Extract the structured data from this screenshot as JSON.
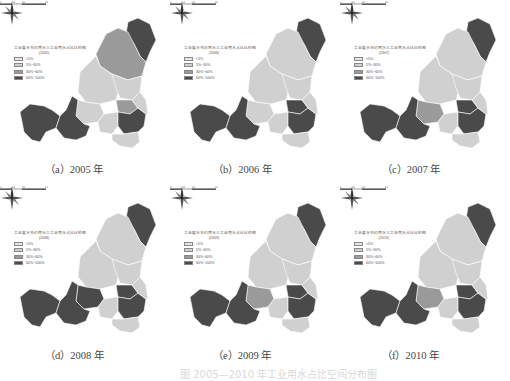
{
  "figure": {
    "legend": {
      "title": "工业废水节约用水三工业用水占比比较图",
      "classes": [
        {
          "label": "<5%",
          "color": "#e6e6e6"
        },
        {
          "label": "5%~30%",
          "color": "#d0d0d0"
        },
        {
          "label": "30%~60%",
          "color": "#9a9a9a"
        },
        {
          "label": "60%~100%",
          "color": "#4a4a4a"
        }
      ]
    },
    "scale_ticks": [
      "0",
      "15",
      "30",
      "60"
    ],
    "panels": [
      {
        "id": "a",
        "caption": "（a）2005 年",
        "year_tag": "(2005)",
        "classes": {
          "north_tip": 3,
          "north": 2,
          "center": 1,
          "right": 1,
          "mid_left": 1,
          "mid_right_small": 2,
          "south_mid": 1,
          "se_dark": 3,
          "se_bottom": 1,
          "west_left": 3,
          "west_right": 3,
          "east_strip": 1
        }
      },
      {
        "id": "b",
        "caption": "（b）2006 年",
        "year_tag": "(2006)",
        "classes": {
          "north_tip": 3,
          "north": 1,
          "center": 1,
          "right": 1,
          "mid_left": 1,
          "mid_right_small": 3,
          "south_mid": 1,
          "se_dark": 3,
          "se_bottom": 1,
          "west_left": 3,
          "west_right": 3,
          "east_strip": 1
        }
      },
      {
        "id": "c",
        "caption": "（c）2007 年",
        "year_tag": "(2007)",
        "classes": {
          "north_tip": 3,
          "north": 1,
          "center": 1,
          "right": 1,
          "mid_left": 2,
          "mid_right_small": 3,
          "south_mid": 1,
          "se_dark": 3,
          "se_bottom": 1,
          "west_left": 3,
          "west_right": 3,
          "east_strip": 1
        }
      },
      {
        "id": "d",
        "caption": "（d）2008 年",
        "year_tag": "(2008)",
        "classes": {
          "north_tip": 3,
          "north": 1,
          "center": 1,
          "right": 1,
          "mid_left": 3,
          "mid_right_small": 3,
          "south_mid": 1,
          "se_dark": 3,
          "se_bottom": 1,
          "west_left": 3,
          "west_right": 3,
          "east_strip": 1
        }
      },
      {
        "id": "e",
        "caption": "（e）2009 年",
        "year_tag": "(2009)",
        "classes": {
          "north_tip": 3,
          "north": 1,
          "center": 1,
          "right": 1,
          "mid_left": 2,
          "mid_right_small": 3,
          "south_mid": 1,
          "se_dark": 3,
          "se_bottom": 1,
          "west_left": 3,
          "west_right": 3,
          "east_strip": 1
        }
      },
      {
        "id": "f",
        "caption": "（f）2010 年",
        "year_tag": "(2010)",
        "classes": {
          "north_tip": 3,
          "north": 1,
          "center": 1,
          "right": 1,
          "mid_left": 2,
          "mid_right_small": 3,
          "south_mid": 1,
          "se_dark": 3,
          "se_bottom": 1,
          "west_left": 3,
          "west_right": 3,
          "east_strip": 1
        }
      }
    ],
    "bottom_caption": "图  2005—2010 年工业用水占比空间分布图"
  }
}
